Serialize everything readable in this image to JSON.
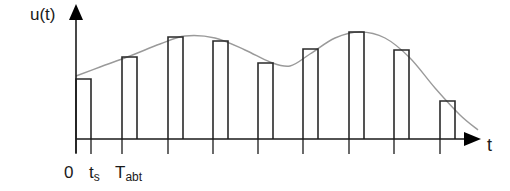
{
  "diagram": {
    "y_axis_label": "u(t)",
    "x_axis_label": "t",
    "tick_labels": [
      {
        "main": "0",
        "sub": ""
      },
      {
        "main": "t",
        "sub": "s"
      },
      {
        "main": "T",
        "sub": "abt"
      }
    ],
    "colors": {
      "axis": "#1a1a1a",
      "pulse": "#2a2a2a",
      "curve": "#9a9a9a",
      "background": "#ffffff"
    }
  },
  "chart_data": {
    "type": "bar",
    "pulses": [
      {
        "index": 0,
        "left": 76,
        "top": 79
      },
      {
        "index": 1,
        "left": 122,
        "top": 57
      },
      {
        "index": 2,
        "left": 168,
        "top": 37
      },
      {
        "index": 3,
        "left": 213,
        "top": 41
      },
      {
        "index": 4,
        "left": 258,
        "top": 63
      },
      {
        "index": 5,
        "left": 303,
        "top": 49
      },
      {
        "index": 6,
        "left": 349,
        "top": 32
      },
      {
        "index": 7,
        "left": 394,
        "top": 50
      },
      {
        "index": 8,
        "left": 440,
        "top": 101
      }
    ],
    "pulse_width": 15,
    "baseline_y": 139,
    "curve_points": [
      [
        76,
        76
      ],
      [
        100,
        67
      ],
      [
        130,
        56
      ],
      [
        160,
        44
      ],
      [
        185,
        36
      ],
      [
        215,
        38
      ],
      [
        245,
        50
      ],
      [
        270,
        62
      ],
      [
        290,
        66
      ],
      [
        310,
        54
      ],
      [
        335,
        38
      ],
      [
        360,
        32
      ],
      [
        385,
        38
      ],
      [
        410,
        58
      ],
      [
        435,
        88
      ],
      [
        460,
        115
      ],
      [
        478,
        130
      ]
    ]
  }
}
